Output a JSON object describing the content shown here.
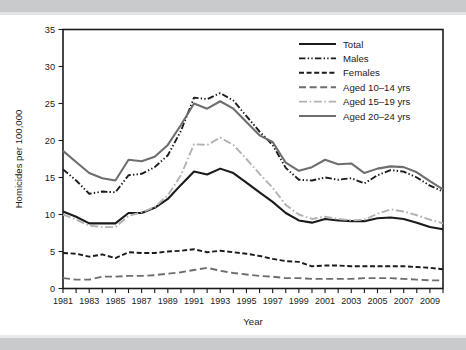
{
  "chart_data": {
    "type": "line",
    "title": "",
    "xlabel": "Year",
    "ylabel": "Homicides per 100,000",
    "xlim": [
      1981,
      2010
    ],
    "ylim": [
      0,
      35
    ],
    "yticks": [
      0,
      5,
      10,
      15,
      20,
      25,
      30,
      35
    ],
    "ytick_labels": [
      "0",
      "5",
      "10",
      "15",
      "20",
      "25",
      "30",
      "35"
    ],
    "xticks": [
      1981,
      1982,
      1983,
      1984,
      1985,
      1986,
      1987,
      1988,
      1989,
      1990,
      1991,
      1992,
      1993,
      1994,
      1995,
      1996,
      1997,
      1998,
      1999,
      2000,
      2001,
      2002,
      2003,
      2004,
      2005,
      2006,
      2007,
      2008,
      2009,
      2010
    ],
    "xtick_labels_shown": [
      "1981",
      "1983",
      "1985",
      "1987",
      "1989",
      "1991",
      "1993",
      "1995",
      "1997",
      "1999",
      "2001",
      "2003",
      "2005",
      "2007",
      "2009"
    ],
    "grid": false,
    "legend_position": "top-right",
    "x": [
      1981,
      1982,
      1983,
      1984,
      1985,
      1986,
      1987,
      1988,
      1989,
      1990,
      1991,
      1992,
      1993,
      1994,
      1995,
      1996,
      1997,
      1998,
      1999,
      2000,
      2001,
      2002,
      2003,
      2004,
      2005,
      2006,
      2007,
      2008,
      2009,
      2010
    ],
    "series": [
      {
        "name": "Total",
        "color": "#1b1b1b",
        "width": 2.1,
        "dash": "none",
        "values": [
          10.4,
          9.7,
          8.8,
          8.8,
          8.8,
          10.2,
          10.2,
          10.9,
          12.1,
          14.0,
          15.8,
          15.4,
          16.2,
          15.6,
          14.3,
          13.0,
          11.7,
          10.2,
          9.2,
          8.9,
          9.4,
          9.2,
          9.1,
          9.1,
          9.5,
          9.6,
          9.4,
          8.9,
          8.3,
          8.0
        ]
      },
      {
        "name": "Males",
        "color": "#1b1b1b",
        "width": 1.9,
        "dash": "dash-dot-dot",
        "values": [
          16.1,
          14.6,
          12.8,
          13.1,
          13.0,
          15.3,
          15.5,
          16.4,
          18.0,
          21.3,
          25.8,
          25.6,
          26.4,
          25.4,
          23.3,
          21.2,
          19.4,
          16.3,
          14.7,
          14.6,
          15.0,
          14.7,
          14.9,
          14.2,
          15.3,
          16.0,
          15.8,
          15.0,
          13.9,
          13.1
        ]
      },
      {
        "name": "Females",
        "color": "#1b1b1b",
        "width": 1.9,
        "dash": "dash",
        "values": [
          4.8,
          4.7,
          4.3,
          4.6,
          4.1,
          4.9,
          4.8,
          4.8,
          5.0,
          5.1,
          5.3,
          4.9,
          5.1,
          4.9,
          4.7,
          4.4,
          4.0,
          3.7,
          3.6,
          3.0,
          3.1,
          3.1,
          3.0,
          3.0,
          3.0,
          3.0,
          3.0,
          2.9,
          2.8,
          2.6
        ]
      },
      {
        "name": "Aged 10–14 yrs",
        "color": "#6d6e70",
        "width": 1.9,
        "dash": "longdash",
        "values": [
          1.4,
          1.2,
          1.2,
          1.6,
          1.6,
          1.7,
          1.7,
          1.8,
          2.0,
          2.2,
          2.5,
          2.8,
          2.4,
          2.1,
          1.9,
          1.7,
          1.6,
          1.4,
          1.4,
          1.3,
          1.3,
          1.3,
          1.3,
          1.4,
          1.4,
          1.4,
          1.3,
          1.2,
          1.1,
          1.1
        ]
      },
      {
        "name": "Aged 15–19 yrs",
        "color": "#b0b2b4",
        "width": 1.9,
        "dash": "dash-dot",
        "values": [
          10.0,
          9.3,
          8.5,
          8.3,
          8.3,
          9.8,
          10.3,
          11.0,
          12.6,
          15.3,
          19.5,
          19.4,
          20.4,
          19.4,
          17.5,
          15.5,
          13.6,
          11.3,
          10.0,
          9.4,
          9.7,
          9.4,
          9.2,
          9.3,
          10.1,
          10.7,
          10.4,
          9.9,
          9.3,
          8.8
        ]
      },
      {
        "name": "Aged 20–24 yrs",
        "color": "#6d6e70",
        "width": 2.1,
        "dash": "none",
        "values": [
          18.6,
          17.1,
          15.6,
          14.9,
          14.6,
          17.4,
          17.2,
          17.8,
          19.4,
          22.1,
          25.0,
          24.3,
          25.3,
          24.3,
          22.5,
          20.7,
          19.8,
          17.0,
          15.9,
          16.4,
          17.4,
          16.8,
          16.9,
          15.6,
          16.2,
          16.5,
          16.4,
          15.7,
          14.5,
          13.4
        ]
      }
    ]
  },
  "legend": {
    "items": [
      {
        "label": "Total"
      },
      {
        "label": "Males"
      },
      {
        "label": "Females"
      },
      {
        "label": "Aged 10–14 yrs"
      },
      {
        "label": "Aged 15–19 yrs"
      },
      {
        "label": "Aged 20–24 yrs"
      }
    ]
  }
}
